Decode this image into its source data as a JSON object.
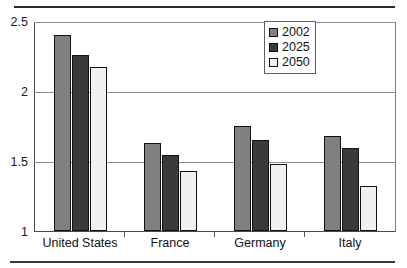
{
  "chart_data": {
    "type": "bar",
    "title": "",
    "subtitle": "",
    "xlabel": "",
    "ylabel": "",
    "categories": [
      "United States",
      "France",
      "Germany",
      "Italy"
    ],
    "series": [
      {
        "name": "2002",
        "color": "#808080",
        "values": [
          2.4,
          1.63,
          1.75,
          1.68
        ]
      },
      {
        "name": "2025",
        "color": "#3a3a3a",
        "values": [
          2.26,
          1.54,
          1.65,
          1.59
        ]
      },
      {
        "name": "2050",
        "color": "#f0f0f0",
        "values": [
          2.17,
          1.43,
          1.48,
          1.32
        ]
      }
    ],
    "ylim": [
      1,
      2.5
    ],
    "yticks": [
      1,
      1.5,
      2,
      2.5
    ],
    "ytick_labels": [
      "1",
      "1.5",
      "2",
      "2.5"
    ],
    "grid": true,
    "gridlines_at": [
      1.5,
      2,
      2.5
    ],
    "legend_position": "top-right",
    "bar_outline_color": "#111111",
    "axis_color": "#4a4a4a",
    "gridline_color": "#8d8d8d"
  }
}
